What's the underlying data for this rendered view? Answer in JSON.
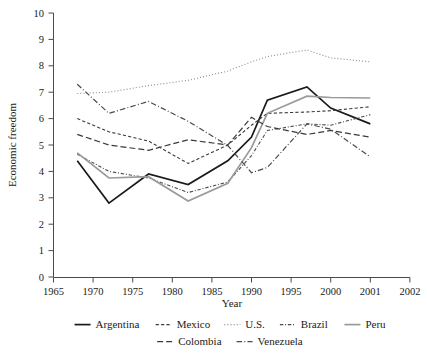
{
  "chart_data": {
    "type": "line",
    "title": "",
    "xlabel": "Year",
    "ylabel": "Economic freedom",
    "xlim": [
      1965,
      2002
    ],
    "ylim": [
      0,
      10
    ],
    "grid": false,
    "legend_position": "bottom",
    "x_tick_labels": [
      "1965",
      "1970",
      "1975",
      "1980",
      "1985",
      "1990",
      "1995",
      "2000",
      "2001",
      "2002"
    ],
    "x_tick_values": [
      1965,
      1970,
      1975,
      1980,
      1985,
      1990,
      1995,
      2000,
      2001,
      2002
    ],
    "y_tick_labels": [
      "0",
      "1",
      "2",
      "3",
      "4",
      "5",
      "6",
      "7",
      "8",
      "9",
      "10"
    ],
    "y_tick_values": [
      0,
      1,
      2,
      3,
      4,
      5,
      6,
      7,
      8,
      9,
      10
    ],
    "x": [
      1968,
      1972,
      1977,
      1982,
      1987,
      1990,
      1992,
      1997,
      2000,
      2001
    ],
    "series": [
      {
        "name": "Argentina",
        "style": "solid",
        "color": "#1a1a1a",
        "width": 1.7,
        "values": [
          4.4,
          2.8,
          3.9,
          3.5,
          4.4,
          5.3,
          6.7,
          7.2,
          6.4,
          5.8
        ]
      },
      {
        "name": "Mexico",
        "style": "dash-short",
        "color": "#3a3a3a",
        "width": 1.1,
        "values": [
          6.0,
          5.5,
          5.15,
          4.3,
          5.0,
          5.75,
          6.2,
          6.25,
          6.3,
          6.45
        ]
      },
      {
        "name": "U.S.",
        "style": "dotted",
        "color": "#8a8a8a",
        "width": 1.1,
        "values": [
          6.95,
          7.0,
          7.25,
          7.45,
          7.8,
          8.15,
          8.35,
          8.6,
          8.3,
          8.15
        ]
      },
      {
        "name": "Brazil",
        "style": "dash-dot-short",
        "color": "#4a4a4a",
        "width": 1.1,
        "values": [
          4.65,
          4.0,
          3.75,
          3.2,
          3.6,
          4.6,
          5.55,
          5.8,
          5.75,
          6.15
        ]
      },
      {
        "name": "Peru",
        "style": "solid",
        "color": "#9a9a9a",
        "width": 1.7,
        "values": [
          4.7,
          3.75,
          3.8,
          2.88,
          3.55,
          4.9,
          6.2,
          6.85,
          6.8,
          6.78
        ]
      },
      {
        "name": "Colombia",
        "style": "dash-long",
        "color": "#3a3a3a",
        "width": 1.2,
        "values": [
          5.4,
          5.0,
          4.8,
          5.2,
          5.0,
          6.05,
          5.7,
          5.4,
          5.55,
          5.3
        ]
      },
      {
        "name": "Venezuela",
        "style": "dash-dot-long",
        "color": "#4a4a4a",
        "width": 1.2,
        "values": [
          7.3,
          6.2,
          6.65,
          5.9,
          4.98,
          3.95,
          4.15,
          5.8,
          5.6,
          4.55
        ]
      }
    ]
  },
  "legend": {
    "row1": [
      "Argentina",
      "Mexico",
      "U.S.",
      "Brazil",
      "Peru"
    ],
    "row2": [
      "Colombia",
      "Venezuela"
    ]
  }
}
